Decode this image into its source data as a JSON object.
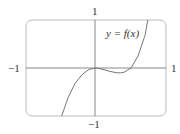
{
  "chart_data": {
    "type": "line",
    "title": "",
    "xlabel": "",
    "ylabel": "",
    "xlim": [
      -1,
      1
    ],
    "ylim": [
      -1,
      1
    ],
    "grid": false,
    "axes_through_origin": true,
    "tick_labels": {
      "x_left": "−1",
      "x_right": "1",
      "y_top": "1",
      "y_bottom": "−1"
    },
    "annotations": [
      {
        "text": "y = f(x)",
        "x": 0.14,
        "y": 0.7
      }
    ],
    "series": [
      {
        "name": "y = f(x)",
        "description": "cubic-like curve: rises from bottom-left, local max at origin, local min near x≈0.35 (y≈−0.1), recrosses x-axis near x≈0.5, exits top near x≈0.74",
        "x": [
          -0.49,
          -0.4,
          -0.3,
          -0.2,
          -0.1,
          0.0,
          0.1,
          0.2,
          0.3,
          0.35,
          0.4,
          0.5,
          0.6,
          0.7,
          0.74
        ],
        "y": [
          -1.0,
          -0.62,
          -0.32,
          -0.14,
          -0.03,
          0.0,
          -0.03,
          -0.07,
          -0.1,
          -0.1,
          -0.09,
          0.0,
          0.25,
          0.68,
          1.0
        ]
      }
    ]
  },
  "colors": {
    "frame": "#bbbbbb",
    "axes": "#888888",
    "curve": "#777777",
    "text": "#333333"
  }
}
